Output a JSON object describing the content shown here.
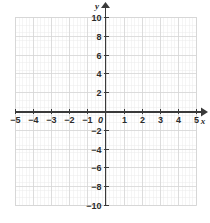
{
  "chart_data": {
    "type": "scatter",
    "title": "",
    "subtitle": "",
    "xlabel": "x",
    "ylabel": "y",
    "xlim": [
      -5,
      5
    ],
    "ylim": [
      -10,
      10
    ],
    "x_tick_step": 1,
    "y_tick_step": 2,
    "x_minor_per_unit": 5,
    "y_minor_per_unit": 2.5,
    "grid": true,
    "grid_minor": true,
    "legend": null,
    "series": [],
    "x_tick_labels": [
      "-5",
      "-4",
      "-3",
      "-2",
      "-1",
      "0",
      "1",
      "2",
      "3",
      "4",
      "5"
    ],
    "x_tick_values": [
      -5,
      -4,
      -3,
      -2,
      -1,
      0,
      1,
      2,
      3,
      4,
      5
    ],
    "y_tick_labels": [
      "10",
      "8",
      "6",
      "4",
      "2",
      "-2",
      "-4",
      "-6",
      "-8",
      "-10"
    ],
    "y_tick_values": [
      10,
      8,
      6,
      4,
      2,
      -2,
      -4,
      -6,
      -8,
      -10
    ],
    "origin_label": "0",
    "colors": {
      "background": "#ffffff",
      "grid_minor": "#ebebeb",
      "grid_major": "#d8d8d8",
      "axis": "#3a3a3a",
      "text": "#2b2b2b"
    },
    "annotations": []
  },
  "axes": {
    "x_name": "x",
    "y_name": "y"
  }
}
